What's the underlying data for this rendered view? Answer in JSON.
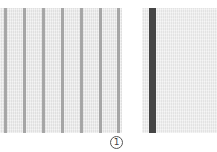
{
  "figure": {
    "label": "1",
    "swatches": [
      {
        "name": "pinstripe-swatch",
        "background": "#e9e9e9",
        "stripe_color": "#9a9a9a",
        "stripe_width_px": 3,
        "stripe_positions_px": [
          4,
          23,
          42,
          61,
          80,
          99,
          117
        ]
      },
      {
        "name": "single-stripe-swatch",
        "background": "#ececec",
        "stripe_color": "#454545",
        "stripe_width_px": 7,
        "stripe_positions_px": [
          7
        ]
      }
    ]
  }
}
